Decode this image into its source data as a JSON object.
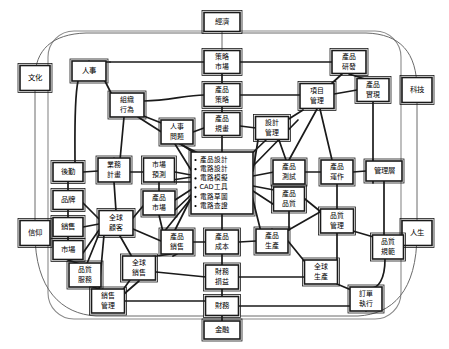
{
  "diagram": {
    "colors": {
      "node_fill": "#ffffff",
      "node_stroke": "#1a1a1a",
      "edge": "#1a1a1a",
      "frame": "#8a8a8a"
    },
    "outer_labels": [
      {
        "id": "economy",
        "label": "經濟",
        "x": 222,
        "y": 22,
        "w": 36,
        "h": 19
      },
      {
        "id": "culture",
        "label": "文化",
        "x": 35,
        "y": 78,
        "w": 30,
        "h": 25
      },
      {
        "id": "technology",
        "label": "科技",
        "x": 417,
        "y": 90,
        "w": 30,
        "h": 25
      },
      {
        "id": "belief",
        "label": "信仰",
        "x": 35,
        "y": 233,
        "w": 30,
        "h": 25
      },
      {
        "id": "life",
        "label": "人生",
        "x": 417,
        "y": 233,
        "w": 30,
        "h": 25
      },
      {
        "id": "finance_o",
        "label": "金融",
        "x": 222,
        "y": 330,
        "w": 36,
        "h": 18
      }
    ],
    "nodes": [
      {
        "id": "strategy-market",
        "lines": [
          "策略",
          "市場"
        ],
        "x": 222,
        "y": 62,
        "w": 36,
        "h": 23
      },
      {
        "id": "product-rd",
        "lines": [
          "產品",
          "研發"
        ],
        "x": 349,
        "y": 62,
        "w": 34,
        "h": 23
      },
      {
        "id": "hr",
        "lines": [
          "人事"
        ],
        "x": 89,
        "y": 71,
        "w": 34,
        "h": 20
      },
      {
        "id": "product-strategy",
        "lines": [
          "產品",
          "策略"
        ],
        "x": 222,
        "y": 95,
        "w": 36,
        "h": 23
      },
      {
        "id": "product-realize",
        "lines": [
          "產品",
          "實現"
        ],
        "x": 373,
        "y": 90,
        "w": 32,
        "h": 23
      },
      {
        "id": "project-mgmt",
        "lines": [
          "項目",
          "管理"
        ],
        "x": 317,
        "y": 96,
        "w": 34,
        "h": 25
      },
      {
        "id": "org-behavior",
        "lines": [
          "組織",
          "行為"
        ],
        "x": 127,
        "y": 105,
        "w": 34,
        "h": 24
      },
      {
        "id": "product-plan",
        "lines": [
          "產品",
          "規畫"
        ],
        "x": 222,
        "y": 124,
        "w": 36,
        "h": 23
      },
      {
        "id": "design-mgmt",
        "lines": [
          "設計",
          "管理"
        ],
        "x": 272,
        "y": 128,
        "w": 33,
        "h": 23
      },
      {
        "id": "hr-issues",
        "lines": [
          "人事",
          "問題"
        ],
        "x": 177,
        "y": 132,
        "w": 32,
        "h": 24
      },
      {
        "id": "logistics",
        "lines": [
          "後勤"
        ],
        "x": 68,
        "y": 172,
        "w": 30,
        "h": 19
      },
      {
        "id": "business-plan",
        "lines": [
          "業務",
          "計畫"
        ],
        "x": 114,
        "y": 170,
        "w": 32,
        "h": 24
      },
      {
        "id": "market-forecast",
        "lines": [
          "市場",
          "預測"
        ],
        "x": 159,
        "y": 170,
        "w": 31,
        "h": 24
      },
      {
        "id": "product-test",
        "lines": [
          "產品",
          "測試"
        ],
        "x": 289,
        "y": 172,
        "w": 32,
        "h": 24
      },
      {
        "id": "product-operate",
        "lines": [
          "產品",
          "運作"
        ],
        "x": 337,
        "y": 172,
        "w": 32,
        "h": 24
      },
      {
        "id": "management-layer",
        "lines": [
          "管理層"
        ],
        "x": 384,
        "y": 171,
        "w": 36,
        "h": 20
      },
      {
        "id": "brand",
        "lines": [
          "品牌"
        ],
        "x": 68,
        "y": 200,
        "w": 30,
        "h": 19
      },
      {
        "id": "product-market",
        "lines": [
          "產品",
          "市場"
        ],
        "x": 159,
        "y": 203,
        "w": 32,
        "h": 24
      },
      {
        "id": "product-quality",
        "lines": [
          "產品",
          "品質"
        ],
        "x": 289,
        "y": 199,
        "w": 31,
        "h": 24
      },
      {
        "id": "sales",
        "lines": [
          "銷售"
        ],
        "x": 68,
        "y": 227,
        "w": 30,
        "h": 19
      },
      {
        "id": "global-customer",
        "lines": [
          "全球",
          "顧客"
        ],
        "x": 116,
        "y": 223,
        "w": 34,
        "h": 25
      },
      {
        "id": "quality-mgmt",
        "lines": [
          "品質",
          "管理"
        ],
        "x": 337,
        "y": 221,
        "w": 33,
        "h": 24
      },
      {
        "id": "market",
        "lines": [
          "市場"
        ],
        "x": 68,
        "y": 250,
        "w": 30,
        "h": 19
      },
      {
        "id": "product-sales",
        "lines": [
          "產品",
          "銷售"
        ],
        "x": 177,
        "y": 242,
        "w": 32,
        "h": 24
      },
      {
        "id": "product-cost",
        "lines": [
          "產品",
          "成本"
        ],
        "x": 222,
        "y": 242,
        "w": 33,
        "h": 24
      },
      {
        "id": "product-produce",
        "lines": [
          "產品",
          "生產"
        ],
        "x": 272,
        "y": 241,
        "w": 32,
        "h": 24
      },
      {
        "id": "quality-spec",
        "lines": [
          "品質",
          "規範"
        ],
        "x": 388,
        "y": 247,
        "w": 31,
        "h": 24
      },
      {
        "id": "quality-service",
        "lines": [
          "品質",
          "服務"
        ],
        "x": 85,
        "y": 275,
        "w": 32,
        "h": 24
      },
      {
        "id": "global-sales",
        "lines": [
          "全球",
          "銷售"
        ],
        "x": 139,
        "y": 268,
        "w": 33,
        "h": 24
      },
      {
        "id": "finance-pl",
        "lines": [
          "財務",
          "損益"
        ],
        "x": 222,
        "y": 277,
        "w": 33,
        "h": 24
      },
      {
        "id": "global-produce",
        "lines": [
          "全球",
          "生產"
        ],
        "x": 321,
        "y": 272,
        "w": 33,
        "h": 24
      },
      {
        "id": "sales-mgmt",
        "lines": [
          "銷售",
          "管理"
        ],
        "x": 108,
        "y": 301,
        "w": 33,
        "h": 24
      },
      {
        "id": "order-exec",
        "lines": [
          "訂單",
          "執行"
        ],
        "x": 366,
        "y": 299,
        "w": 32,
        "h": 24
      },
      {
        "id": "finance",
        "lines": [
          "財務"
        ],
        "x": 222,
        "y": 306,
        "w": 33,
        "h": 19
      }
    ],
    "center_node": {
      "id": "design-core",
      "x": 222,
      "y": 183,
      "w": 62,
      "h": 62,
      "items": [
        "產品設計",
        "電路設計",
        "電路模擬",
        "CAD工具",
        "電路草圖",
        "電路查證"
      ]
    }
  }
}
